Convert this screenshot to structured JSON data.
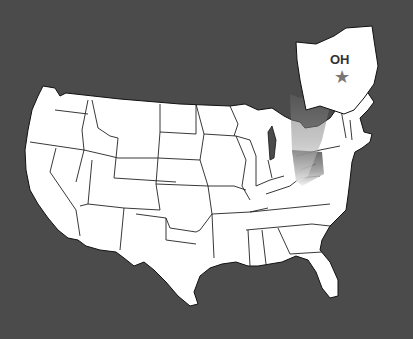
{
  "map": {
    "title": "United States locator map",
    "highlight_state": {
      "abbr": "OH",
      "name": "Ohio",
      "marker": "star-icon"
    },
    "colors": {
      "background": "#4b4b4b",
      "land": "#ffffff",
      "outline": "#111111",
      "lakes": "#4b4b4b",
      "callout_gradient": "#888888",
      "star": "#777777"
    }
  }
}
